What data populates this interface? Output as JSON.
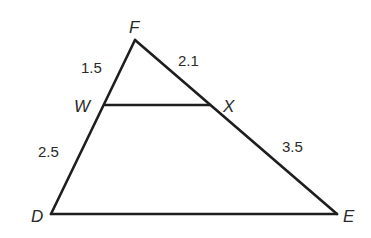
{
  "diagram": {
    "type": "triangle-with-parallel-segment",
    "colors": {
      "stroke": "#1e1e1e",
      "text": "#2a2a2a",
      "background": "#ffffff"
    },
    "vertices": {
      "F": {
        "label": "F",
        "x": 135,
        "y": 40
      },
      "W": {
        "label": "W",
        "x": 105,
        "y": 105
      },
      "X": {
        "label": "X",
        "x": 210,
        "y": 105
      },
      "D": {
        "label": "D",
        "x": 51,
        "y": 214
      },
      "E": {
        "label": "E",
        "x": 337,
        "y": 214
      }
    },
    "segments": [
      {
        "name": "FW",
        "from": "F",
        "to": "W",
        "length": "1.5"
      },
      {
        "name": "WD",
        "from": "W",
        "to": "D",
        "length": "2.5"
      },
      {
        "name": "FX",
        "from": "F",
        "to": "X",
        "length": "2.1"
      },
      {
        "name": "XE",
        "from": "X",
        "to": "E",
        "length": "3.5"
      },
      {
        "name": "WX",
        "from": "W",
        "to": "X",
        "length": ""
      },
      {
        "name": "DE",
        "from": "D",
        "to": "E",
        "length": ""
      }
    ],
    "labels": {
      "F": "F",
      "W": "W",
      "X": "X",
      "D": "D",
      "E": "E",
      "FW": "1.5",
      "FX": "2.1",
      "WD": "2.5",
      "XE": "3.5"
    }
  }
}
